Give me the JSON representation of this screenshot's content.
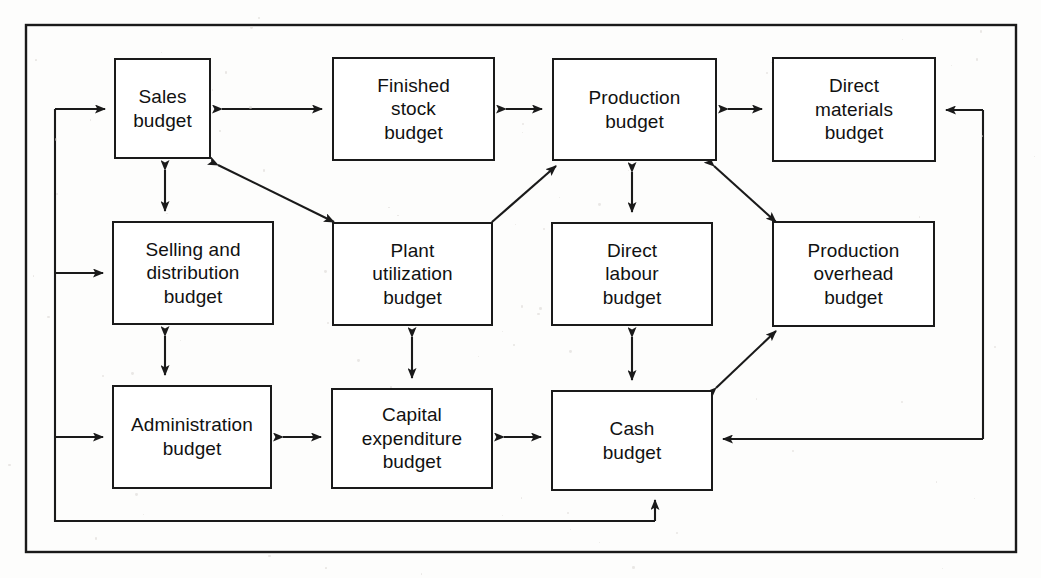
{
  "diagram": {
    "type": "flow-diagram",
    "line_color": "#1a1a1a",
    "box_fill": "#ffffff",
    "background": "#fdfdfc",
    "nodes": [
      {
        "id": "sales",
        "label": "Sales\nbudget",
        "x": 114,
        "y": 58,
        "w": 97,
        "h": 101
      },
      {
        "id": "finished_stock",
        "label": "Finished\nstock\nbudget",
        "x": 332,
        "y": 57,
        "w": 163,
        "h": 104
      },
      {
        "id": "production",
        "label": "Production\nbudget",
        "x": 552,
        "y": 58,
        "w": 165,
        "h": 103
      },
      {
        "id": "direct_mats",
        "label": "Direct\nmaterials\nbudget",
        "x": 772,
        "y": 57,
        "w": 164,
        "h": 105
      },
      {
        "id": "selling",
        "label": "Selling and\ndistribution\nbudget",
        "x": 112,
        "y": 221,
        "w": 162,
        "h": 104
      },
      {
        "id": "plant",
        "label": "Plant\nutilization\nbudget",
        "x": 332,
        "y": 222,
        "w": 161,
        "h": 104
      },
      {
        "id": "direct_labour",
        "label": "Direct\nlabour\nbudget",
        "x": 551,
        "y": 222,
        "w": 162,
        "h": 104
      },
      {
        "id": "prod_overhead",
        "label": "Production\noverhead\nbudget",
        "x": 772,
        "y": 221,
        "w": 163,
        "h": 106
      },
      {
        "id": "administration",
        "label": "Administration\nbudget",
        "x": 112,
        "y": 385,
        "w": 160,
        "h": 104
      },
      {
        "id": "capital_exp",
        "label": "Capital\nexpenditure\nbudget",
        "x": 331,
        "y": 388,
        "w": 162,
        "h": 101
      },
      {
        "id": "cash",
        "label": "Cash\nbudget",
        "x": 551,
        "y": 390,
        "w": 162,
        "h": 101
      }
    ],
    "connections": [
      {
        "from": "sales",
        "to": "finished_stock",
        "kind": "double",
        "orientation": "horizontal"
      },
      {
        "from": "finished_stock",
        "to": "production",
        "kind": "double",
        "orientation": "horizontal"
      },
      {
        "from": "production",
        "to": "direct_mats",
        "kind": "double",
        "orientation": "horizontal"
      },
      {
        "from": "sales",
        "to": "selling",
        "kind": "double",
        "orientation": "vertical"
      },
      {
        "from": "selling",
        "to": "administration",
        "kind": "double",
        "orientation": "vertical"
      },
      {
        "from": "sales",
        "to": "plant",
        "kind": "double",
        "orientation": "diagonal"
      },
      {
        "from": "plant",
        "to": "production",
        "kind": "double",
        "orientation": "diagonal"
      },
      {
        "from": "production",
        "to": "direct_labour",
        "kind": "double",
        "orientation": "vertical"
      },
      {
        "from": "production",
        "to": "prod_overhead",
        "kind": "double",
        "orientation": "diagonal"
      },
      {
        "from": "plant",
        "to": "capital_exp",
        "kind": "double",
        "orientation": "vertical"
      },
      {
        "from": "direct_labour",
        "to": "cash",
        "kind": "double",
        "orientation": "vertical"
      },
      {
        "from": "cash",
        "to": "prod_overhead",
        "kind": "double",
        "orientation": "diagonal"
      },
      {
        "from": "administration",
        "to": "capital_exp",
        "kind": "double",
        "orientation": "horizontal"
      },
      {
        "from": "capital_exp",
        "to": "cash",
        "kind": "double",
        "orientation": "horizontal"
      },
      {
        "from": "feedback_left",
        "to": "sales",
        "kind": "single",
        "orientation": "routed"
      },
      {
        "from": "feedback_left",
        "to": "selling",
        "kind": "single",
        "orientation": "routed"
      },
      {
        "from": "feedback_left",
        "to": "administration",
        "kind": "single",
        "orientation": "routed"
      },
      {
        "from": "cash_loop",
        "to": "cash",
        "kind": "single",
        "orientation": "routed"
      },
      {
        "from": "right_rail",
        "to": "direct_mats",
        "kind": "single",
        "orientation": "routed"
      },
      {
        "from": "right_rail",
        "to": "cash",
        "kind": "single",
        "orientation": "routed"
      }
    ]
  }
}
